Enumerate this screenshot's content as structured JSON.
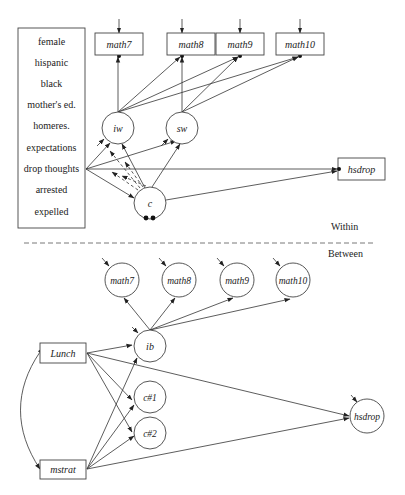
{
  "diagram": {
    "type": "multilevel structural equation model path diagram",
    "within": {
      "section_label": "Within",
      "covariates": [
        "female",
        "hispanic",
        "black",
        "mother's ed.",
        "homeres.",
        "expectations",
        "drop thoughts",
        "arrested",
        "expelled"
      ],
      "observed_outcomes": [
        "math7",
        "math8",
        "math9",
        "math10"
      ],
      "latent_growth_factors": [
        "iw",
        "sw"
      ],
      "latent_class": "c",
      "distal_outcome": "hsdrop"
    },
    "between": {
      "section_label": "Between",
      "random_intercepts": [
        "math7",
        "math8",
        "math9",
        "math10"
      ],
      "latent_factor": "ib",
      "class_intercepts": [
        "c#1",
        "c#2"
      ],
      "distal_outcome": "hsdrop",
      "covariates": [
        "Lunch",
        "mstrat"
      ]
    }
  }
}
